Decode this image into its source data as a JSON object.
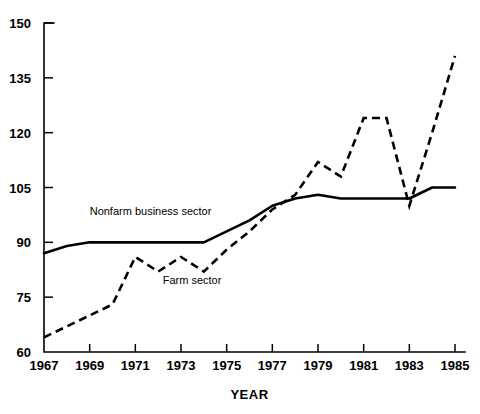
{
  "chart_data": {
    "type": "line",
    "title": "",
    "xlabel": "YEAR",
    "ylabel": "",
    "x": [
      1967,
      1968,
      1969,
      1970,
      1971,
      1972,
      1973,
      1974,
      1975,
      1976,
      1977,
      1978,
      1979,
      1980,
      1981,
      1982,
      1983,
      1984,
      1985
    ],
    "xlim": [
      1967,
      1985
    ],
    "ylim": [
      60,
      150
    ],
    "xticks": [
      1967,
      1969,
      1971,
      1973,
      1975,
      1977,
      1979,
      1981,
      1983,
      1985
    ],
    "xtick_labels": [
      "1967",
      "1969",
      "1971",
      "1973",
      "1975",
      "1977",
      "1979",
      "1981",
      "1983",
      "1985"
    ],
    "yticks": [
      60,
      75,
      90,
      105,
      120,
      135,
      150
    ],
    "ytick_labels": [
      "60",
      "75",
      "90",
      "105",
      "120",
      "135",
      "150"
    ],
    "grid": false,
    "legend_position": "inline-annotation",
    "series": [
      {
        "name": "Nonfarm business sector",
        "style": "solid",
        "color": "#000000",
        "label_x": 1969.0,
        "label_y": 97.5,
        "values": [
          87,
          89,
          90,
          90,
          90,
          90,
          90,
          90,
          93,
          96,
          100,
          102,
          103,
          102,
          102,
          102,
          102,
          105,
          105
        ]
      },
      {
        "name": "Farm sector",
        "style": "dashed",
        "color": "#000000",
        "label_x": 1972.2,
        "label_y": 78.5,
        "values": [
          64,
          67,
          70,
          73,
          86,
          82,
          86,
          82,
          88,
          93,
          99,
          103,
          112,
          108,
          124,
          124,
          100,
          120,
          141
        ]
      }
    ]
  }
}
